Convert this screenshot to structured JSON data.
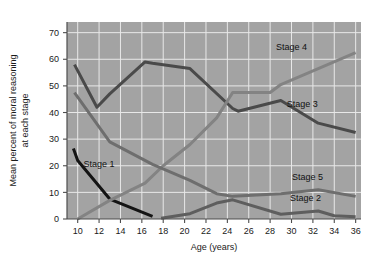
{
  "chart_data": {
    "type": "line",
    "title": "",
    "xlabel": "Age (years)",
    "ylabel": "Mean percent of moral reasoning at each stage",
    "ylabel_line1": "Mean percent of moral reasoning",
    "ylabel_line2": "at each stage",
    "xlim": [
      9,
      36.5
    ],
    "ylim": [
      0,
      74
    ],
    "xticks": [
      10,
      12,
      14,
      16,
      18,
      20,
      22,
      24,
      26,
      28,
      30,
      32,
      34,
      36
    ],
    "yticks": [
      0,
      10,
      20,
      30,
      40,
      50,
      60,
      70
    ],
    "xtick_labels": [
      "10",
      "12",
      "14",
      "16",
      "18",
      "20",
      "22",
      "24",
      "26",
      "28",
      "30",
      "32",
      "34",
      "36"
    ],
    "ytick_labels": [
      "0",
      "10",
      "20",
      "30",
      "40",
      "50",
      "60",
      "70"
    ],
    "grid": true,
    "legend_position": "inline-labels",
    "plot_background": "#a3a3a3",
    "grid_color": "#e8e8e8",
    "series": [
      {
        "name": "Stage 1",
        "label": "Stage 1",
        "color": "#141414",
        "width": 3.0,
        "label_x": 12.0,
        "label_y": 19.5,
        "x": [
          9.6,
          10.0,
          13.0,
          17.0
        ],
        "values": [
          26.5,
          22.0,
          7.5,
          1.0
        ]
      },
      {
        "name": "Stage 2",
        "label": "Stage 2",
        "color": "#5e5e5e",
        "width": 3.0,
        "label_x": 31.3,
        "label_y": 6.6,
        "x": [
          17.8,
          20.5,
          23.0,
          24.5,
          29.0,
          32.5,
          34.0,
          36.0
        ],
        "values": [
          0.3,
          2.0,
          6.0,
          7.2,
          1.8,
          3.0,
          1.2,
          0.8
        ]
      },
      {
        "name": "Stage 3",
        "label": "Stage 3",
        "color": "#4a4a4a",
        "width": 3.0,
        "label_x": 31.0,
        "label_y": 42.0,
        "x": [
          9.7,
          11.8,
          13.0,
          16.3,
          17.0,
          20.5,
          24.5,
          25.0,
          29.0,
          32.5,
          36.0
        ],
        "values": [
          58.0,
          42.0,
          47.0,
          59.0,
          58.5,
          56.5,
          41.5,
          40.5,
          44.5,
          36.0,
          32.5
        ]
      },
      {
        "name": "Stage 4",
        "label": "Stage 4",
        "color": "#838383",
        "width": 3.0,
        "label_x": 30.0,
        "label_y": 63.5,
        "x": [
          10.0,
          13.0,
          16.3,
          18.0,
          20.5,
          23.0,
          24.5,
          28.0,
          29.0,
          32.5,
          36.0
        ],
        "values": [
          0.0,
          7.0,
          13.5,
          20.0,
          28.0,
          38.0,
          47.5,
          47.5,
          50.5,
          56.5,
          62.5
        ]
      },
      {
        "name": "Stage 5",
        "label": "Stage 5",
        "color": "#6e6e6e",
        "width": 3.0,
        "label_x": 31.5,
        "label_y": 14.5,
        "x": [
          9.7,
          13.0,
          17.0,
          20.5,
          23.0,
          24.5,
          29.0,
          32.5,
          36.0
        ],
        "values": [
          47.5,
          29.0,
          20.5,
          14.5,
          9.5,
          8.5,
          9.5,
          11.0,
          8.5
        ]
      }
    ]
  }
}
